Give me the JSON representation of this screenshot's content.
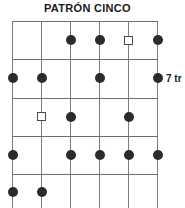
{
  "diagram": {
    "title": "PATRÓN CINCO",
    "type": "guitar-fretboard-pattern",
    "orientation": "vertical",
    "string_count": 6,
    "fret_row_count": 5,
    "position_label": "7 tr",
    "colors": {
      "background": "#ffffff",
      "grid_line": "#7d7d7d",
      "fret_line": "#6e6e6e",
      "filled_marker": "#2b2b2b",
      "hollow_marker_border": "#4a4a4a",
      "hollow_marker_fill": "#ffffff",
      "text": "#1a1a1a"
    },
    "geometry": {
      "string_x": [
        12.5,
        41.5,
        70.5,
        99.5,
        128.5,
        157.5
      ],
      "fret_y": [
        21,
        58.5,
        97.5,
        135.5,
        173.5,
        208
      ],
      "row_center_y": [
        40,
        78,
        116.5,
        154.5,
        192
      ],
      "grid_left": 12.5,
      "grid_right": 157.5,
      "grid_top": 21
    },
    "markers": [
      {
        "string": 3,
        "row": 1,
        "x": 70.5,
        "y": 40,
        "shape": "filled-circle"
      },
      {
        "string": 4,
        "row": 1,
        "x": 99.5,
        "y": 40,
        "shape": "filled-circle"
      },
      {
        "string": 5,
        "row": 1,
        "x": 128.5,
        "y": 40,
        "shape": "hollow-square"
      },
      {
        "string": 6,
        "row": 1,
        "x": 157.5,
        "y": 40,
        "shape": "filled-circle"
      },
      {
        "string": 1,
        "row": 2,
        "x": 12.5,
        "y": 78,
        "shape": "filled-circle"
      },
      {
        "string": 2,
        "row": 2,
        "x": 41.5,
        "y": 78,
        "shape": "filled-circle"
      },
      {
        "string": 4,
        "row": 2,
        "x": 99.5,
        "y": 78,
        "shape": "filled-circle"
      },
      {
        "string": 6,
        "row": 2,
        "x": 157.5,
        "y": 78,
        "shape": "filled-circle"
      },
      {
        "string": 2,
        "row": 3,
        "x": 41.5,
        "y": 116.5,
        "shape": "hollow-square"
      },
      {
        "string": 3,
        "row": 3,
        "x": 70.5,
        "y": 116.5,
        "shape": "filled-circle"
      },
      {
        "string": 5,
        "row": 3,
        "x": 128.5,
        "y": 116.5,
        "shape": "filled-circle"
      },
      {
        "string": 1,
        "row": 4,
        "x": 12.5,
        "y": 154.5,
        "shape": "filled-circle"
      },
      {
        "string": 3,
        "row": 4,
        "x": 70.5,
        "y": 154.5,
        "shape": "filled-circle"
      },
      {
        "string": 4,
        "row": 4,
        "x": 99.5,
        "y": 154.5,
        "shape": "filled-circle"
      },
      {
        "string": 5,
        "row": 4,
        "x": 128.5,
        "y": 154.5,
        "shape": "filled-circle"
      },
      {
        "string": 6,
        "row": 4,
        "x": 157.5,
        "y": 154.5,
        "shape": "filled-circle"
      },
      {
        "string": 1,
        "row": 5,
        "x": 12.5,
        "y": 192,
        "shape": "filled-circle"
      },
      {
        "string": 2,
        "row": 5,
        "x": 41.5,
        "y": 192,
        "shape": "filled-circle"
      }
    ],
    "position_label_pos": {
      "x": 166,
      "y": 73
    }
  }
}
